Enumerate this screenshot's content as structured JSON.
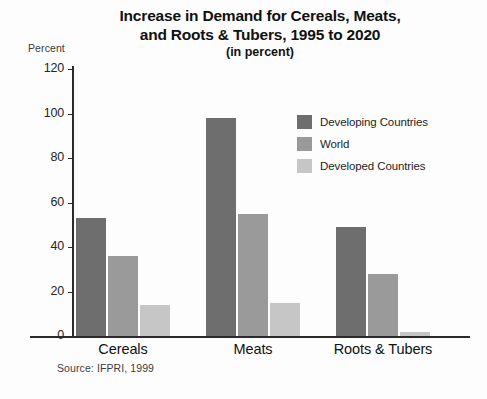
{
  "chart_data": {
    "type": "bar",
    "title": "Increase in Demand for Cereals, Meats, and Roots & Tubers, 1995 to 2020",
    "title_lines": [
      "Increase in Demand for Cereals, Meats,",
      "and Roots & Tubers, 1995 to 2020"
    ],
    "subtitle": "(in percent)",
    "xlabel": "",
    "ylabel": "Percent",
    "ylim": [
      0,
      120
    ],
    "ytick_labels": [
      "120",
      "100",
      "80",
      "60",
      "40",
      "20",
      "0"
    ],
    "ytick_values": [
      120,
      100,
      80,
      60,
      40,
      20,
      0
    ],
    "grid": false,
    "legend_position": "inside-upper-right",
    "categories": [
      "Cereals",
      "Meats",
      "Roots & Tubers"
    ],
    "series": [
      {
        "name": "Developing Countries",
        "color": "#6e6e6e",
        "values": [
          53,
          98,
          49
        ]
      },
      {
        "name": "World",
        "color": "#9a9a9a",
        "values": [
          36,
          55,
          28
        ]
      },
      {
        "name": "Developed Countries",
        "color": "#c6c6c6",
        "values": [
          14,
          15,
          2
        ]
      }
    ],
    "source": "Source: IFPRI, 1999"
  }
}
